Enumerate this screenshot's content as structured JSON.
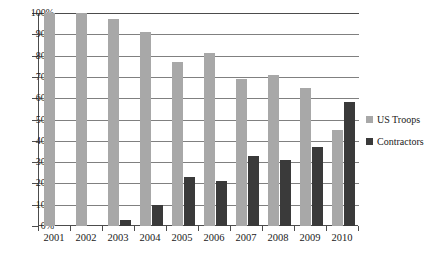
{
  "chart_data": {
    "type": "bar",
    "title": "",
    "subtitle": "",
    "xlabel": "",
    "ylabel": "",
    "ylim": [
      0,
      100
    ],
    "y_ticks": [
      "0%",
      "10%",
      "20%",
      "30%",
      "40%",
      "50%",
      "60%",
      "70%",
      "80%",
      "90%",
      "100%"
    ],
    "y_tick_values": [
      0,
      10,
      20,
      30,
      40,
      50,
      60,
      70,
      80,
      90,
      100
    ],
    "grid": true,
    "legend_position": "right",
    "categories": [
      "2001",
      "2002",
      "2003",
      "2004",
      "2005",
      "2006",
      "2007",
      "2008",
      "2009",
      "2010"
    ],
    "series": [
      {
        "name": "US Troops",
        "color": "#a8a8a8",
        "values": [
          100,
          100,
          97,
          91,
          77,
          81,
          69,
          71,
          65,
          45
        ]
      },
      {
        "name": "Contractors",
        "color": "#3a3a3a",
        "values": [
          0,
          0,
          3,
          10,
          23,
          21,
          33,
          31,
          37,
          58
        ]
      }
    ]
  },
  "legend": {
    "entries": [
      {
        "label": "US Troops"
      },
      {
        "label": "Contractors"
      }
    ]
  },
  "colors": {
    "troops": "#a8a8a8",
    "contractors": "#3a3a3a",
    "axis": "#4c4c4c",
    "gridline": "#808080",
    "background": "#ffffff",
    "text": "#1a1a1a"
  }
}
